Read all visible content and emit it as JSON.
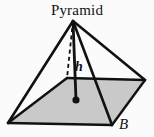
{
  "figure": {
    "type": "geometry-diagram",
    "title": "Pyramid",
    "background_color": "#fbfbfb",
    "stroke_color": "#111111",
    "base_fill_color": "#c9c9c9",
    "labels": {
      "title": "Pyramid",
      "height": "h",
      "base": "B"
    },
    "geometry": {
      "apex": [
        73,
        21
      ],
      "base_vertices": {
        "left": [
          8,
          123
        ],
        "back": [
          67,
          78
        ],
        "right": [
          145,
          80
        ],
        "front": [
          112,
          125
        ]
      },
      "base_center": [
        76,
        100
      ],
      "height_segment": [
        [
          73,
          21
        ],
        [
          76,
          100
        ]
      ],
      "hidden_edge": [
        [
          73,
          21
        ],
        [
          67,
          78
        ]
      ],
      "solid_edges": [
        [
          [
            73,
            21
          ],
          [
            8,
            123
          ]
        ],
        [
          [
            73,
            21
          ],
          [
            145,
            80
          ]
        ],
        [
          [
            73,
            21
          ],
          [
            112,
            125
          ]
        ]
      ],
      "base_edges": [
        [
          [
            8,
            123
          ],
          [
            67,
            78
          ]
        ],
        [
          [
            67,
            78
          ],
          [
            145,
            80
          ]
        ],
        [
          [
            145,
            80
          ],
          [
            112,
            125
          ]
        ],
        [
          [
            112,
            125
          ],
          [
            8,
            123
          ]
        ]
      ],
      "center_dot_radius": 3.6
    }
  }
}
